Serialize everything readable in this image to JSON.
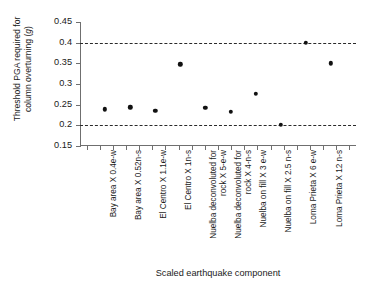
{
  "chart_data": {
    "type": "scatter",
    "title": "",
    "xlabel": "Scaled earthquake component",
    "ylabel_lines": [
      "Threshold PGA required for",
      "column overturning (g)"
    ],
    "ylabel_italic_token": "g",
    "ylim": [
      0.15,
      0.45
    ],
    "yticks": [
      "0.15",
      "0.2",
      "0.25",
      "0.3",
      "0.35",
      "0.4",
      "0.45"
    ],
    "ytick_values": [
      0.15,
      0.2,
      0.25,
      0.3,
      0.35,
      0.4,
      0.45
    ],
    "grid": false,
    "legend": "none",
    "reference_lines": [
      {
        "value": 0.4,
        "style": "dashed"
      },
      {
        "value": 0.2,
        "style": "dashed"
      }
    ],
    "categories": [
      "Bay area X 0.4e-w",
      "Bay area X 0.52n-s",
      "El Centro X 1.1e-w",
      "El Centro X 1n-s",
      "Nuelba deconvoluted for rock X 5-e-w",
      "Nuelba deconvoluted for rock X 4-n-s",
      "Nuelba on fill X 3 e-w",
      "Nuelba on fill X 2.5 n-s",
      "Loma Prieta X 6 e-w",
      "Loma Prieta X 12 n-s"
    ],
    "category_lines": [
      [
        "Bay area X 0.4e-w"
      ],
      [
        "Bay area X 0.52n-s"
      ],
      [
        "El Centro X 1.1e-w"
      ],
      [
        "El Centro X 1n-s"
      ],
      [
        "Nuelba deconvoluted for",
        "rock X 5-e-w"
      ],
      [
        "Nuelba deconvoluted for",
        "rock X 4-n-s"
      ],
      [
        "Nuelba on fill X 3 e-w"
      ],
      [
        "Nuelba on fill X 2.5 n-s"
      ],
      [
        "Loma Prieta X 6 e-w"
      ],
      [
        "Loma Prieta X 12 n-s"
      ]
    ],
    "values": [
      0.239,
      0.244,
      0.235,
      0.348,
      0.242,
      0.233,
      0.276,
      0.201,
      0.4,
      0.35
    ],
    "marker": "filled-circle",
    "marker_color": "#111111"
  }
}
